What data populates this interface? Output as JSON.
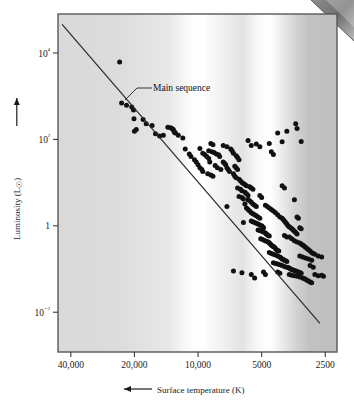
{
  "figure": {
    "kind": "hr-diagram",
    "background_color": "#ffffff",
    "frame_color": "#4a4a4a",
    "point_color": "#111111",
    "line_color": "#2a2a2a"
  },
  "annotations": {
    "main_sequence_label": "Main sequence"
  },
  "axes": {
    "x_title_prefix_icon": "left-arrow-icon",
    "x_title": "Surface temperature (K)",
    "y_title": "Luminosity (L",
    "y_title_symbol": "☉",
    "y_title_suffix": ")",
    "y_title_icon": "up-arrow-icon"
  },
  "chart_data": {
    "type": "scatter",
    "title": "",
    "xlabel": "Surface temperature (K)",
    "ylabel": "Luminosity (L☉)",
    "xscale": "log-reversed",
    "yscale": "log",
    "xlim": [
      46000,
      2200
    ],
    "ylim": [
      0.0012,
      80000
    ],
    "grid": false,
    "legend": false,
    "xticks": [
      40000,
      20000,
      10000,
      5000,
      2500
    ],
    "xticklabels": [
      "40,000",
      "20,000",
      "10,000",
      "5000",
      "2500"
    ],
    "yticks": [
      10000,
      100,
      1,
      0.01
    ],
    "yticklabels": [
      "10⁴",
      "10²",
      "1",
      "10⁻²"
    ],
    "background_spectrum": {
      "description": "stellar color spectrum band, light at hot/white bands, darker gray at cool end",
      "stops": [
        {
          "pos": 0.0,
          "color": "#d9d9d9"
        },
        {
          "pos": 0.22,
          "color": "#dcdcdc"
        },
        {
          "pos": 0.4,
          "color": "#e8e8e8"
        },
        {
          "pos": 0.47,
          "color": "#fbfbfb"
        },
        {
          "pos": 0.52,
          "color": "#ffffff"
        },
        {
          "pos": 0.58,
          "color": "#f2f2f2"
        },
        {
          "pos": 0.66,
          "color": "#e3e3e3"
        },
        {
          "pos": 0.72,
          "color": "#fafafa"
        },
        {
          "pos": 0.76,
          "color": "#ffffff"
        },
        {
          "pos": 0.8,
          "color": "#ededed"
        },
        {
          "pos": 0.855,
          "color": "#d2d2d2"
        },
        {
          "pos": 0.9,
          "color": "#c2c2c2"
        },
        {
          "pos": 1.0,
          "color": "#bfbfbf"
        }
      ]
    },
    "main_sequence_line": {
      "label": "Main sequence",
      "x": [
        44000,
        2650
      ],
      "y": [
        46000,
        0.0055
      ]
    },
    "series": [
      {
        "name": "stars",
        "points": [
          [
            23500,
            6200
          ],
          [
            23000,
            700
          ],
          [
            21800,
            620
          ],
          [
            20600,
            560
          ],
          [
            20200,
            480
          ],
          [
            20100,
            300
          ],
          [
            19600,
            170
          ],
          [
            20000,
            155
          ],
          [
            18200,
            290
          ],
          [
            17600,
            230
          ],
          [
            16500,
            210
          ],
          [
            15900,
            135
          ],
          [
            15200,
            120
          ],
          [
            14600,
            125
          ],
          [
            13900,
            190
          ],
          [
            13500,
            185
          ],
          [
            13300,
            180
          ],
          [
            13100,
            170
          ],
          [
            13000,
            155
          ],
          [
            12900,
            145
          ],
          [
            12800,
            140
          ],
          [
            12400,
            125
          ],
          [
            11800,
            108
          ],
          [
            11500,
            60
          ],
          [
            11000,
            46
          ],
          [
            10800,
            40
          ],
          [
            10400,
            34
          ],
          [
            10200,
            30
          ],
          [
            10000,
            26
          ],
          [
            9800,
            22
          ],
          [
            9600,
            20
          ],
          [
            9500,
            18
          ],
          [
            9800,
            62
          ],
          [
            9500,
            48
          ],
          [
            9300,
            45
          ],
          [
            9100,
            40
          ],
          [
            8900,
            36
          ],
          [
            8800,
            30
          ],
          [
            9000,
            16
          ],
          [
            8700,
            15
          ],
          [
            8500,
            14
          ],
          [
            8900,
            55
          ],
          [
            8600,
            52
          ],
          [
            8400,
            50
          ],
          [
            8200,
            46
          ],
          [
            8000,
            44
          ],
          [
            7900,
            40
          ],
          [
            8300,
            25
          ],
          [
            8100,
            22
          ],
          [
            7800,
            20
          ],
          [
            7600,
            30
          ],
          [
            7500,
            28
          ],
          [
            7400,
            26
          ],
          [
            7300,
            22
          ],
          [
            7200,
            20
          ],
          [
            7100,
            18
          ],
          [
            7000,
            60
          ],
          [
            6900,
            55
          ],
          [
            6800,
            48
          ],
          [
            7600,
            72
          ],
          [
            7300,
            68
          ],
          [
            8700,
            80
          ],
          [
            8500,
            75
          ],
          [
            6600,
            42
          ],
          [
            6500,
            38
          ],
          [
            6400,
            34
          ],
          [
            6700,
            24
          ],
          [
            6600,
            22
          ],
          [
            6500,
            20
          ],
          [
            6800,
            16
          ],
          [
            6700,
            14
          ],
          [
            6600,
            13
          ],
          [
            6400,
            12
          ],
          [
            6300,
            11
          ],
          [
            6200,
            10
          ],
          [
            6100,
            9.5
          ],
          [
            6000,
            9
          ],
          [
            5900,
            8.5
          ],
          [
            6500,
            7.5
          ],
          [
            6300,
            7
          ],
          [
            6200,
            6.5
          ],
          [
            6000,
            6
          ],
          [
            5900,
            5.5
          ],
          [
            5800,
            5
          ],
          [
            6400,
            4.8
          ],
          [
            6200,
            4.5
          ],
          [
            6100,
            4.2
          ],
          [
            5700,
            8
          ],
          [
            5600,
            7.5
          ],
          [
            5500,
            7
          ],
          [
            5800,
            4
          ],
          [
            5700,
            3.8
          ],
          [
            5600,
            3.5
          ],
          [
            5500,
            3.2
          ],
          [
            5400,
            3
          ],
          [
            5300,
            2.8
          ],
          [
            5900,
            2.6
          ],
          [
            5800,
            2.4
          ],
          [
            5700,
            2.2
          ],
          [
            5600,
            2.0
          ],
          [
            5500,
            1.9
          ],
          [
            5400,
            1.8
          ],
          [
            5300,
            1.7
          ],
          [
            5200,
            1.6
          ],
          [
            5100,
            1.5
          ],
          [
            5600,
            1.3
          ],
          [
            5500,
            1.25
          ],
          [
            5400,
            1.2
          ],
          [
            5300,
            1.15
          ],
          [
            5200,
            1.1
          ],
          [
            5100,
            1.05
          ],
          [
            5000,
            1.0
          ],
          [
            4950,
            0.95
          ],
          [
            4900,
            0.9
          ],
          [
            5200,
            0.8
          ],
          [
            5100,
            0.78
          ],
          [
            5000,
            0.75
          ],
          [
            4900,
            0.72
          ],
          [
            4800,
            0.68
          ],
          [
            4750,
            0.65
          ],
          [
            4700,
            0.62
          ],
          [
            4650,
            0.6
          ],
          [
            4600,
            0.58
          ],
          [
            5050,
            0.5
          ],
          [
            4950,
            0.48
          ],
          [
            4850,
            0.46
          ],
          [
            4750,
            0.44
          ],
          [
            4650,
            0.42
          ],
          [
            4600,
            0.4
          ],
          [
            4550,
            0.38
          ],
          [
            4500,
            0.36
          ],
          [
            4450,
            0.34
          ],
          [
            4400,
            0.33
          ],
          [
            4350,
            0.32
          ],
          [
            4300,
            0.3
          ],
          [
            4250,
            0.28
          ],
          [
            4200,
            0.27
          ],
          [
            4150,
            0.26
          ],
          [
            4600,
            0.24
          ],
          [
            4500,
            0.23
          ],
          [
            4400,
            0.22
          ],
          [
            4300,
            0.21
          ],
          [
            4200,
            0.2
          ],
          [
            4100,
            0.19
          ],
          [
            4050,
            0.18
          ],
          [
            4000,
            0.17
          ],
          [
            3950,
            0.165
          ],
          [
            3900,
            0.16
          ],
          [
            3850,
            0.155
          ],
          [
            3800,
            0.15
          ],
          [
            4400,
            0.14
          ],
          [
            4300,
            0.135
          ],
          [
            4200,
            0.13
          ],
          [
            4100,
            0.125
          ],
          [
            4000,
            0.12
          ],
          [
            3900,
            0.115
          ],
          [
            3800,
            0.11
          ],
          [
            3750,
            0.108
          ],
          [
            3700,
            0.105
          ],
          [
            3650,
            0.1
          ],
          [
            3600,
            0.098
          ],
          [
            3550,
            0.095
          ],
          [
            3500,
            0.093
          ],
          [
            3450,
            0.09
          ],
          [
            3400,
            0.088
          ],
          [
            3350,
            0.085
          ],
          [
            3300,
            0.083
          ],
          [
            3250,
            0.08
          ],
          [
            3700,
            0.075
          ],
          [
            3600,
            0.072
          ],
          [
            3500,
            0.07
          ],
          [
            3400,
            0.068
          ],
          [
            3300,
            0.065
          ],
          [
            3200,
            0.062
          ],
          [
            3150,
            0.06
          ],
          [
            3100,
            0.058
          ],
          [
            3050,
            0.055
          ],
          [
            3000,
            0.053
          ],
          [
            2950,
            0.05
          ],
          [
            2900,
            0.048
          ],
          [
            2800,
            0.075
          ],
          [
            2700,
            0.07
          ],
          [
            2600,
            0.072
          ],
          [
            2550,
            0.068
          ],
          [
            4200,
            0.085
          ],
          [
            4100,
            0.08
          ],
          [
            4900,
            0.085
          ],
          [
            4800,
            0.075
          ],
          [
            5400,
            0.062
          ],
          [
            6200,
            0.082
          ],
          [
            5000,
            4.5
          ],
          [
            5100,
            5
          ],
          [
            4800,
            3.0
          ],
          [
            4700,
            2.8
          ],
          [
            4600,
            2.6
          ],
          [
            4500,
            2.4
          ],
          [
            4400,
            2.2
          ],
          [
            4300,
            2.0
          ],
          [
            4200,
            1.8
          ],
          [
            4100,
            1.6
          ],
          [
            4000,
            1.5
          ],
          [
            3950,
            1.4
          ],
          [
            3900,
            1.3
          ],
          [
            3850,
            1.2
          ],
          [
            3800,
            1.1
          ],
          [
            3750,
            1.0
          ],
          [
            3700,
            0.95
          ],
          [
            3650,
            0.9
          ],
          [
            3600,
            0.85
          ],
          [
            3550,
            0.8
          ],
          [
            3500,
            0.75
          ],
          [
            3450,
            0.7
          ],
          [
            3400,
            0.65
          ],
          [
            3700,
            0.55
          ],
          [
            3600,
            0.5
          ],
          [
            3500,
            0.45
          ],
          [
            3400,
            0.42
          ],
          [
            3300,
            0.4
          ],
          [
            3250,
            0.38
          ],
          [
            3900,
            0.6
          ],
          [
            3800,
            0.55
          ],
          [
            3200,
            0.36
          ],
          [
            3150,
            0.34
          ],
          [
            3100,
            0.32
          ],
          [
            3050,
            0.3
          ],
          [
            3000,
            0.28
          ],
          [
            2950,
            0.26
          ],
          [
            2900,
            0.24
          ],
          [
            2850,
            0.23
          ],
          [
            2800,
            0.22
          ],
          [
            3300,
            0.2
          ],
          [
            3200,
            0.19
          ],
          [
            3100,
            0.18
          ],
          [
            3000,
            0.17
          ],
          [
            2900,
            0.16
          ],
          [
            2700,
            0.2
          ],
          [
            2600,
            0.19
          ],
          [
            2950,
            0.12
          ],
          [
            2850,
            0.11
          ],
          [
            3400,
            1.6
          ],
          [
            3350,
            1.5
          ],
          [
            3300,
            0.9
          ],
          [
            3250,
            0.85
          ],
          [
            3500,
            4.0
          ],
          [
            3800,
            155
          ],
          [
            3400,
            180
          ],
          [
            3450,
            230
          ],
          [
            4200,
            140
          ],
          [
            4000,
            88
          ],
          [
            3250,
            90
          ],
          [
            4600,
            80
          ],
          [
            5100,
            68
          ],
          [
            5300,
            78
          ],
          [
            5600,
            72
          ],
          [
            5800,
            95
          ],
          [
            4400,
            45
          ],
          [
            4500,
            52
          ],
          [
            6000,
            3.2
          ],
          [
            6100,
            1.2
          ],
          [
            6800,
            0.09
          ],
          [
            7300,
            2.8
          ],
          [
            5600,
            0.075
          ],
          [
            4000,
            8.5
          ],
          [
            3900,
            7.5
          ]
        ]
      }
    ]
  }
}
